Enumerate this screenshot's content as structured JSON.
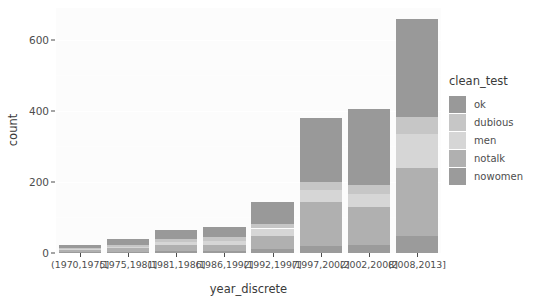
{
  "chart_data": {
    "type": "bar",
    "stacked": true,
    "title": "",
    "xlabel": "year_discrete",
    "ylabel": "count",
    "ylim": [
      0,
      690
    ],
    "yticks": [
      0,
      200,
      400,
      600
    ],
    "grid": true,
    "legend_title": "clean_test",
    "legend_position": "right",
    "categories": [
      "(1970,1975]",
      "(1975,1981]",
      "(1981,1986]",
      "(1986,1992]",
      "(1992,1997]",
      "(1997,2002]",
      "(2002,2008]",
      "(2008,2013]"
    ],
    "series": [
      {
        "name": "ok",
        "color": "#999999",
        "values": [
          8,
          17,
          25,
          30,
          62,
          180,
          215,
          278
        ]
      },
      {
        "name": "dubious",
        "color": "#c6c6c6",
        "values": [
          2,
          4,
          8,
          9,
          12,
          22,
          25,
          47
        ]
      },
      {
        "name": "men",
        "color": "#d6d6d6",
        "values": [
          3,
          5,
          10,
          12,
          20,
          33,
          36,
          97
        ]
      },
      {
        "name": "notalk",
        "color": "#b0b0b0",
        "values": [
          6,
          9,
          17,
          18,
          38,
          124,
          107,
          190
        ]
      },
      {
        "name": "nowomen",
        "color": "#9b9b9b",
        "values": [
          3,
          4,
          5,
          5,
          11,
          21,
          23,
          48
        ]
      }
    ],
    "totals": [
      22,
      39,
      65,
      74,
      143,
      380,
      406,
      660
    ]
  },
  "legend": {
    "title": "clean_test",
    "items": [
      {
        "label": "ok",
        "color": "#999999"
      },
      {
        "label": "dubious",
        "color": "#c6c6c6"
      },
      {
        "label": "men",
        "color": "#d6d6d6"
      },
      {
        "label": "notalk",
        "color": "#b0b0b0"
      },
      {
        "label": "nowomen",
        "color": "#9b9b9b"
      }
    ]
  },
  "axes": {
    "y_title": "count",
    "x_title": "year_discrete",
    "y_tick_labels": [
      "0",
      "200",
      "400",
      "600"
    ],
    "x_tick_labels": [
      "(1970,1975]",
      "(1975,1981]",
      "(1981,1986]",
      "(1986,1992]",
      "(1992,1997]",
      "(1997,2002]",
      "(2002,2008]",
      "(2008,2013]"
    ]
  },
  "theme": {
    "panel_background": "#fcfcfc",
    "gridline_color": "#ffffff",
    "text_color": "#4d4d4d",
    "plot_background": "#ffffff"
  }
}
